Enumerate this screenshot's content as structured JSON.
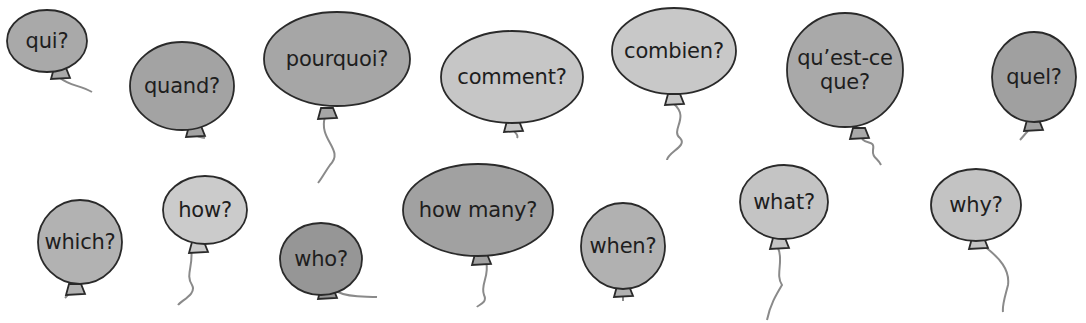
{
  "balloons": [
    {
      "label": "qui?",
      "cx": 47,
      "cy": 41,
      "rx": 40,
      "ry": 31,
      "color": "#a9a9a9",
      "knot": [
        60,
        72
      ],
      "string": "M60 78 C70 86 80 85 92 92"
    },
    {
      "label": "quand?",
      "cx": 182,
      "cy": 86,
      "rx": 52,
      "ry": 44,
      "color": "#a3a3a3",
      "knot": [
        195,
        130
      ],
      "string": "M195 135 C200 138 202 137 205 138"
    },
    {
      "label": "pourquoi?",
      "cx": 337,
      "cy": 59,
      "rx": 73,
      "ry": 47,
      "color": "#a6a6a6",
      "knot": [
        327,
        112
      ],
      "string": "M325 117 C318 140 345 150 330 165 C325 172 322 178 318 183"
    },
    {
      "label": "comment?",
      "cx": 512,
      "cy": 77,
      "rx": 71,
      "ry": 46,
      "color": "#c6c6c6",
      "knot": [
        513,
        125
      ],
      "string": "M513 130 C516 134 519 135 517 138"
    },
    {
      "label": "combien?",
      "cx": 674,
      "cy": 51,
      "rx": 62,
      "ry": 43,
      "color": "#c8c8c8",
      "knot": [
        674,
        98
      ],
      "string": "M674 104 C690 118 670 130 680 138 C688 146 668 152 667 160"
    },
    {
      "label": "qu’est-ce\nque?",
      "cx": 845,
      "cy": 70,
      "rx": 58,
      "ry": 57,
      "color": "#a9a9a9",
      "knot": [
        859,
        132
      ],
      "string": "M862 139 C868 145 875 140 873 150 C872 158 878 158 881 165"
    },
    {
      "label": "quel?",
      "cx": 1034,
      "cy": 77,
      "rx": 42,
      "ry": 45,
      "color": "#a0a0a0",
      "knot": [
        1033,
        124
      ],
      "string": "M1028 131 C1024 135 1022 138 1020 140"
    },
    {
      "label": "which?",
      "cx": 80,
      "cy": 242,
      "rx": 42,
      "ry": 42,
      "color": "#b2b2b2",
      "knot": [
        75,
        288
      ],
      "string": "M70 292 C68 295 66 297 65 298"
    },
    {
      "label": "how?",
      "cx": 205,
      "cy": 210,
      "rx": 42,
      "ry": 34,
      "color": "#cbcbcb",
      "knot": [
        198,
        246
      ],
      "string": "M191 248 C194 265 185 275 192 285 C197 294 182 300 178 305"
    },
    {
      "label": "who?",
      "cx": 321,
      "cy": 259,
      "rx": 41,
      "ry": 36,
      "color": "#969696",
      "knot": [
        327,
        292
      ],
      "string": "M338 292 C350 298 365 296 377 297"
    },
    {
      "label": "how many?",
      "cx": 478,
      "cy": 210,
      "rx": 75,
      "ry": 46,
      "color": "#a1a1a1",
      "knot": [
        481,
        258
      ],
      "string": "M486 262 C490 275 480 285 484 295 C488 303 478 305 477 307"
    },
    {
      "label": "when?",
      "cx": 623,
      "cy": 246,
      "rx": 42,
      "ry": 43,
      "color": "#b1b1b1",
      "knot": [
        623,
        290
      ],
      "string": "M623 296 L623 301"
    },
    {
      "label": "what?",
      "cx": 784,
      "cy": 202,
      "rx": 44,
      "ry": 37,
      "color": "#c4c4c4",
      "knot": [
        779,
        242
      ],
      "string": "M778 248 C784 260 775 275 782 285 C776 295 770 305 767 320"
    },
    {
      "label": "why?",
      "cx": 976,
      "cy": 205,
      "rx": 45,
      "ry": 36,
      "color": "#c3c3c3",
      "knot": [
        978,
        242
      ],
      "string": "M984 246 C1000 258 1010 270 1008 285 C1005 297 1002 305 1003 312"
    }
  ],
  "style": {
    "outline": "#2a2a2a",
    "string": "#8a8a8a",
    "background": "#ffffff"
  }
}
